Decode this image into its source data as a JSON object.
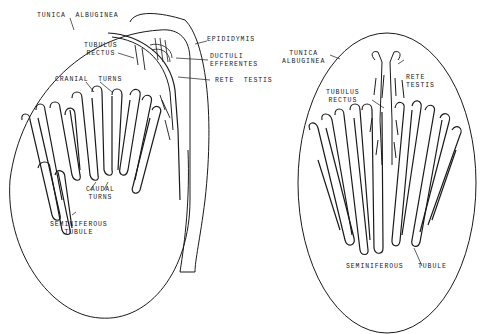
{
  "figure": {
    "left_panel": {
      "labels": {
        "tunica_albuginea": "TUNICA  ALBUGINEA",
        "epididymis": "EPIDIDYMIS",
        "tubulus_rectus_1": "TUBULUS",
        "tubulus_rectus_2": "RECTUS",
        "ductuli_efferentes_1": "DUCTULI",
        "ductuli_efferentes_2": "EFFERENTES",
        "rete_testis": "RETE  TESTIS",
        "cranial_turns": "CRANIAL  TURNS",
        "caudal_turns_1": "CAUDAL",
        "caudal_turns_2": "TURNS",
        "seminiferous_tubule_1": "SEMINIFEROUS",
        "seminiferous_tubule_2": "TUBULE"
      }
    },
    "right_panel": {
      "labels": {
        "tunica_albuginea_1": "TUNICA",
        "tunica_albuginea_2": "ALBUGINEA",
        "rete_testis_1": "RETE",
        "rete_testis_2": "TESTIS",
        "tubulus_rectus_1": "TUBULUS",
        "tubulus_rectus_2": "RECTUS",
        "seminiferous_tubule": "SEMINIFEROUS   TUBULE"
      }
    },
    "colors": {
      "ink": "#1a1a1a",
      "background": "#ffffff"
    }
  }
}
